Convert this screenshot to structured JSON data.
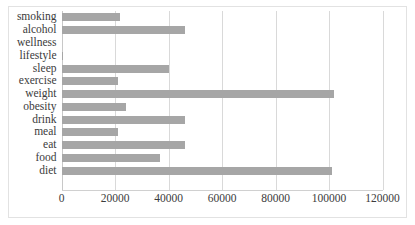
{
  "chart_data": {
    "type": "bar",
    "orientation": "horizontal",
    "title": "",
    "xlabel": "",
    "ylabel": "",
    "xlim": [
      0,
      120000
    ],
    "xticks": [
      0,
      20000,
      40000,
      60000,
      80000,
      100000,
      120000
    ],
    "xtick_labels": [
      "0",
      "20000",
      "40000",
      "60000",
      "80000",
      "100000",
      "120000"
    ],
    "grid": true,
    "grid_axis": "x",
    "legend": false,
    "bar_color": "#a6a6a6",
    "categories": [
      "smoking",
      "alcohol",
      "wellness",
      "lifestyle",
      "sleep",
      "exercise",
      "weight",
      "obesity",
      "drink",
      "meal",
      "eat",
      "food",
      "diet"
    ],
    "values": [
      22000,
      46000,
      0,
      700,
      40000,
      21000,
      102000,
      24000,
      46000,
      21000,
      46000,
      37000,
      101000
    ],
    "bars": [
      {
        "label": "smoking",
        "value": 22000
      },
      {
        "label": "alcohol",
        "value": 46000
      },
      {
        "label": "wellness",
        "value": 0
      },
      {
        "label": "lifestyle",
        "value": 700
      },
      {
        "label": "sleep",
        "value": 40000
      },
      {
        "label": "exercise",
        "value": 21000
      },
      {
        "label": "weight",
        "value": 102000
      },
      {
        "label": "obesity",
        "value": 24000
      },
      {
        "label": "drink",
        "value": 46000
      },
      {
        "label": "meal",
        "value": 21000
      },
      {
        "label": "eat",
        "value": 46000
      },
      {
        "label": "food",
        "value": 37000
      },
      {
        "label": "diet",
        "value": 101000
      }
    ]
  }
}
